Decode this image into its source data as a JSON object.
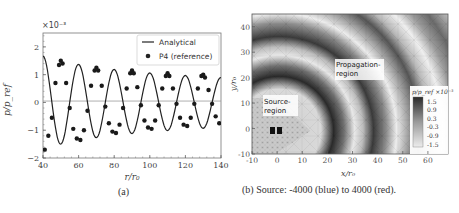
{
  "panel_a": {
    "caption": "(a)",
    "exponent_label": "×10⁻³",
    "xlabel": "r/r₀",
    "ylabel": "p/p_ref",
    "legend": [
      "Analytical",
      "P4 (reference)"
    ],
    "xticks": [
      "40",
      "60",
      "80",
      "100",
      "120",
      "140"
    ],
    "yticks": [
      "−2",
      "−1",
      "0",
      "1",
      "2"
    ]
  },
  "panel_b": {
    "caption": "(b) Source: -4000 (blue) to 4000 (red).",
    "xlabel": "x/r₀",
    "ylabel": "y/r₀",
    "xticks": [
      "-10",
      "0",
      "10",
      "20",
      "30",
      "40",
      "50",
      "60"
    ],
    "yticks": [
      "-10",
      "0",
      "10",
      "20",
      "30",
      "40"
    ],
    "source_label_1": "Source-",
    "source_label_2": "region",
    "propagation_label_1": "Propagation-",
    "propagation_label_2": "region",
    "colorbar_title": "p/p_ref ×10⁻³",
    "colorbar_ticks": [
      "1.5",
      "0.9",
      "0.3",
      "-0.3",
      "-0.9",
      "-1.5"
    ]
  },
  "chart_data": [
    {
      "type": "line",
      "title": "",
      "xlabel": "r/r₀",
      "ylabel": "p/p_ref (×10⁻³)",
      "xlim": [
        40,
        140
      ],
      "ylim": [
        -2,
        2.5
      ],
      "grid": false,
      "legend_position": "upper right",
      "series": [
        {
          "name": "Analytical",
          "style": "solid line",
          "x": [
            40,
            41,
            45,
            50,
            55,
            61,
            65,
            70,
            75,
            81,
            85,
            90,
            95,
            101,
            105,
            110,
            115,
            121,
            125,
            130,
            135,
            140
          ],
          "values": [
            -1.65,
            -1.7,
            0.0,
            1.5,
            0.0,
            -1.35,
            0.0,
            1.25,
            0.0,
            -1.1,
            0.0,
            1.15,
            0.0,
            -0.95,
            0.0,
            1.05,
            0.0,
            -0.85,
            0.0,
            1.0,
            0.0,
            -0.75
          ]
        },
        {
          "name": "P4 (reference)",
          "style": "markers",
          "x": [
            41,
            43,
            45,
            47,
            49,
            50,
            51,
            53,
            55,
            57,
            59,
            61,
            63,
            65,
            67,
            69,
            70,
            71,
            73,
            75,
            77,
            79,
            81,
            83,
            85,
            87,
            89,
            90,
            91,
            93,
            95,
            97,
            99,
            101,
            103,
            105,
            107,
            109,
            110,
            111,
            113,
            115,
            117,
            119,
            121,
            123,
            125,
            127,
            129,
            130,
            131,
            133,
            135,
            137,
            139
          ],
          "values": [
            -1.7,
            -1.2,
            -0.55,
            0.7,
            1.35,
            1.5,
            1.4,
            0.7,
            -0.2,
            -0.95,
            -1.3,
            -1.35,
            -1.0,
            -0.3,
            0.6,
            1.15,
            1.25,
            1.15,
            0.6,
            -0.15,
            -0.75,
            -1.05,
            -1.1,
            -0.8,
            -0.2,
            0.5,
            1.05,
            1.15,
            1.05,
            0.55,
            -0.1,
            -0.65,
            -0.9,
            -0.95,
            -0.65,
            -0.1,
            0.5,
            0.95,
            1.05,
            0.95,
            0.5,
            -0.05,
            -0.55,
            -0.8,
            -0.85,
            -0.55,
            -0.05,
            0.5,
            0.95,
            1.0,
            0.9,
            0.45,
            -0.05,
            -0.5,
            -0.75
          ]
        },
        {
          "name": "zero reference",
          "style": "thin gray line",
          "x": [
            40,
            140
          ],
          "values": [
            0.05,
            0.05
          ]
        }
      ]
    },
    {
      "type": "heatmap",
      "title": "Source: -4000 (blue) to 4000 (red)",
      "xlabel": "x/r₀",
      "ylabel": "y/r₀",
      "xlim": [
        -10,
        68
      ],
      "ylim": [
        -10,
        45
      ],
      "colorbar": {
        "label": "p/p_ref ×10⁻³",
        "ticks": [
          1.5,
          0.9,
          0.3,
          -0.3,
          -0.9,
          -1.5
        ],
        "range": [
          -1.5,
          1.5
        ]
      },
      "annotations": [
        "Source-region",
        "Propagation-region"
      ],
      "features": {
        "source_points": [
          [
            -1.5,
            0
          ],
          [
            1.0,
            0
          ]
        ],
        "source_region": "diamond/triangle fine mesh, apex at x≈21, y≈0",
        "wavefronts_radii_approx": [
          24,
          38,
          52,
          66
        ]
      }
    }
  ]
}
